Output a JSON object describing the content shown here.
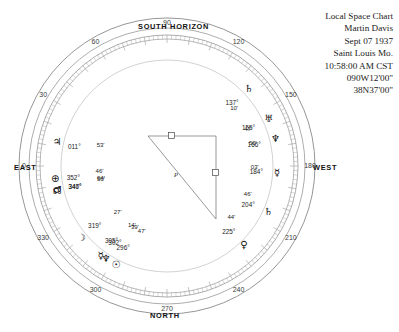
{
  "header": {
    "lines": [
      "Local Space Chart",
      "Martin Davis",
      "Sept 07 1937",
      "Saint Louis Mo.",
      "10:58:00 AM CST",
      "090W12'00\"",
      "38N37'00\""
    ]
  },
  "cardinals": {
    "south": "SOUTH  HORIZON",
    "north": "NORTH",
    "east": "EAST",
    "west": "WEST"
  },
  "ticks": [
    {
      "label": "0",
      "azimuth": 0
    },
    {
      "label": "30",
      "azimuth": 30
    },
    {
      "label": "60",
      "azimuth": 60
    },
    {
      "label": "90",
      "azimuth": 90
    },
    {
      "label": "120",
      "azimuth": 120
    },
    {
      "label": "150",
      "azimuth": 150
    },
    {
      "label": "180",
      "azimuth": 180
    },
    {
      "label": "210",
      "azimuth": 210
    },
    {
      "label": "240",
      "azimuth": 240
    },
    {
      "label": "270",
      "azimuth": 270
    },
    {
      "label": "300",
      "azimuth": 300
    },
    {
      "label": "330",
      "azimuth": 330
    }
  ],
  "planets": [
    {
      "name": "sun",
      "glyph": "☉",
      "deg": "296°",
      "min": "47'"
    },
    {
      "name": "neptune",
      "glyph": "♆",
      "deg": "302°",
      "min": "39'"
    },
    {
      "name": "mercury",
      "glyph": "☿",
      "deg": "305°",
      "min": "14'"
    },
    {
      "name": "moon",
      "glyph": "☽",
      "deg": "319°",
      "min": "27'"
    },
    {
      "name": "north-node",
      "glyph": "☊",
      "deg": "346°",
      "min": "50'"
    },
    {
      "name": "mars",
      "glyph": "♂",
      "deg": "347°",
      "min": "04'"
    },
    {
      "name": "pluto",
      "glyph": "⊕",
      "deg": "352°",
      "min": "46'"
    },
    {
      "name": "jupiter",
      "glyph": "♃",
      "deg": "011°",
      "min": "53'"
    },
    {
      "name": "venus",
      "glyph": "♀",
      "deg": "225°",
      "min": "44'"
    },
    {
      "name": "saturn-b",
      "glyph": "♄",
      "deg": "204°",
      "min": "46'"
    },
    {
      "name": "mercury-b",
      "glyph": "☿",
      "deg": "184°",
      "min": "03'"
    },
    {
      "name": "neptune-b",
      "glyph": "♆",
      "deg": "166°",
      "min": "50'"
    },
    {
      "name": "uranus",
      "glyph": "♅",
      "deg": "155°",
      "min": "47'"
    },
    {
      "name": "saturn",
      "glyph": "♄",
      "deg": "137°",
      "min": "10'"
    }
  ],
  "aspect_label": "P",
  "chart_data": {
    "type": "scatter",
    "title": "Local Space Chart",
    "subtitle": "Martin Davis — Sept 07 1937, Saint Louis Mo., 10:58:00 AM CST",
    "coordinate_system": "azimuth-polar",
    "xlabel": "Azimuth (degrees)",
    "ylabel": "",
    "axis_range": [
      0,
      360
    ],
    "grid": true,
    "legend_position": "none",
    "orientation": {
      "0": "EAST",
      "90": "NORTH",
      "180": "WEST",
      "270": "SOUTH HORIZON"
    },
    "tick_labels": [
      "0",
      "30",
      "60",
      "90",
      "120",
      "150",
      "180",
      "210",
      "240",
      "270",
      "300",
      "330"
    ],
    "categories": [
      "Sun",
      "Neptune",
      "Mercury",
      "Moon",
      "North Node",
      "Mars",
      "Pluto",
      "Jupiter",
      "Venus",
      "Saturn",
      "Mercury",
      "Neptune",
      "Uranus",
      "Saturn"
    ],
    "values": [
      296.783,
      302.65,
      305.233,
      319.45,
      346.833,
      347.067,
      352.767,
      11.883,
      225.733,
      204.767,
      184.05,
      166.833,
      155.783,
      137.167
    ],
    "series": [
      {
        "name": "Local Space azimuths",
        "points": [
          {
            "body": "Sun",
            "azimuth_deg": 296,
            "azimuth_min": 47
          },
          {
            "body": "Neptune",
            "azimuth_deg": 302,
            "azimuth_min": 39
          },
          {
            "body": "Mercury",
            "azimuth_deg": 305,
            "azimuth_min": 14
          },
          {
            "body": "Moon",
            "azimuth_deg": 319,
            "azimuth_min": 27
          },
          {
            "body": "North Node",
            "azimuth_deg": 346,
            "azimuth_min": 50
          },
          {
            "body": "Mars",
            "azimuth_deg": 347,
            "azimuth_min": 4
          },
          {
            "body": "Pluto",
            "azimuth_deg": 352,
            "azimuth_min": 46
          },
          {
            "body": "Jupiter",
            "azimuth_deg": 11,
            "azimuth_min": 53
          },
          {
            "body": "Venus",
            "azimuth_deg": 225,
            "azimuth_min": 44
          },
          {
            "body": "Saturn",
            "azimuth_deg": 204,
            "azimuth_min": 46
          },
          {
            "body": "Mercury",
            "azimuth_deg": 184,
            "azimuth_min": 3
          },
          {
            "body": "Neptune",
            "azimuth_deg": 166,
            "azimuth_min": 50
          },
          {
            "body": "Uranus",
            "azimuth_deg": 155,
            "azimuth_min": 47
          },
          {
            "body": "Saturn",
            "azimuth_deg": 137,
            "azimuth_min": 10
          }
        ]
      }
    ],
    "annotations": [
      "P"
    ]
  }
}
